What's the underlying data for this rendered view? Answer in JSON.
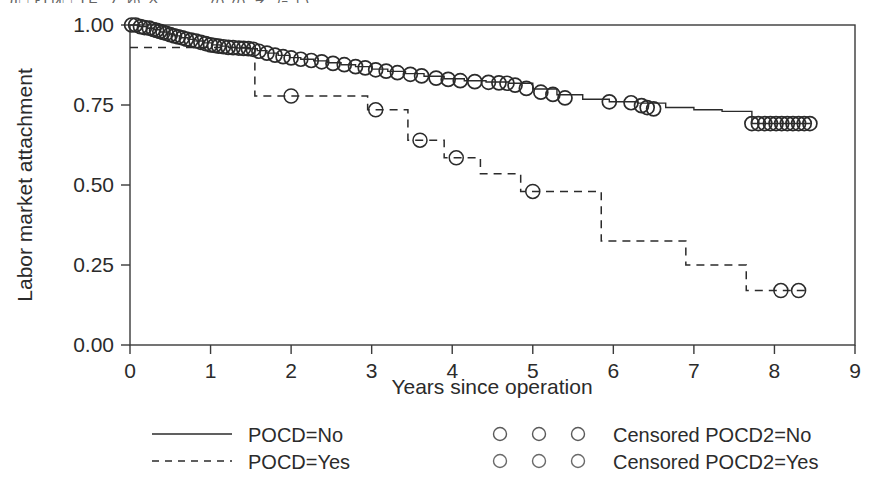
{
  "figure": {
    "top_cut_text": "Д□ гТИ□ ТЕ ノ ゆ へ こ こ の の え た い 二",
    "background": "#ffffff",
    "line_color": "#2b2b2b"
  },
  "chart_data": {
    "type": "line",
    "title": "",
    "subtitle": "",
    "xlabel": "Years since operation",
    "ylabel": "Labor market attachment",
    "xlim": [
      0,
      9
    ],
    "ylim": [
      0,
      1
    ],
    "xticks": [
      0,
      1,
      2,
      3,
      4,
      5,
      6,
      7,
      8,
      9
    ],
    "xtick_labels": [
      "0",
      "1",
      "2",
      "3",
      "4",
      "5",
      "6",
      "7",
      "8",
      "9"
    ],
    "yticks": [
      0.0,
      0.25,
      0.5,
      0.75,
      1.0
    ],
    "ytick_labels": [
      "0.00",
      "0.25",
      "0.50",
      "0.75",
      "1.00"
    ],
    "grid": false,
    "legend_position": "below-axes",
    "step_type": "post",
    "series": [
      {
        "name": "POCD=No",
        "style": "solid",
        "x": [
          0.0,
          0.12,
          0.22,
          0.3,
          0.38,
          0.46,
          0.55,
          0.64,
          0.72,
          0.82,
          0.92,
          1.02,
          1.12,
          1.22,
          1.33,
          1.45,
          1.58,
          1.7,
          1.84,
          1.98,
          2.12,
          2.28,
          2.45,
          2.62,
          2.8,
          3.0,
          3.2,
          3.42,
          3.65,
          3.9,
          4.15,
          4.42,
          4.7,
          5.0,
          5.3,
          5.62,
          5.95,
          6.3,
          6.65,
          7.0,
          7.35,
          7.72,
          8.45
        ],
        "y": [
          1.0,
          0.995,
          0.99,
          0.985,
          0.978,
          0.972,
          0.966,
          0.96,
          0.955,
          0.95,
          0.944,
          0.938,
          0.934,
          0.93,
          0.928,
          0.926,
          0.92,
          0.912,
          0.905,
          0.898,
          0.893,
          0.888,
          0.882,
          0.876,
          0.87,
          0.862,
          0.855,
          0.848,
          0.84,
          0.832,
          0.826,
          0.822,
          0.818,
          0.8,
          0.782,
          0.768,
          0.76,
          0.756,
          0.742,
          0.735,
          0.73,
          0.692,
          0.692
        ]
      },
      {
        "name": "POCD=Yes",
        "style": "dashed",
        "x": [
          0.0,
          1.55,
          2.95,
          3.45,
          3.9,
          4.35,
          4.85,
          5.85,
          6.9,
          7.65,
          8.4
        ],
        "y": [
          0.93,
          0.778,
          0.735,
          0.64,
          0.585,
          0.535,
          0.48,
          0.325,
          0.25,
          0.17,
          0.17
        ]
      }
    ],
    "censored_marks": [
      {
        "name": "Censored POCD2=No",
        "marker": "open-circle",
        "points": [
          [
            0.02,
            1.0
          ],
          [
            0.07,
            1.0
          ],
          [
            0.13,
            0.995
          ],
          [
            0.18,
            0.992
          ],
          [
            0.24,
            0.99
          ],
          [
            0.29,
            0.986
          ],
          [
            0.33,
            0.983
          ],
          [
            0.37,
            0.98
          ],
          [
            0.41,
            0.977
          ],
          [
            0.45,
            0.974
          ],
          [
            0.5,
            0.97
          ],
          [
            0.55,
            0.966
          ],
          [
            0.6,
            0.963
          ],
          [
            0.65,
            0.96
          ],
          [
            0.7,
            0.956
          ],
          [
            0.76,
            0.953
          ],
          [
            0.82,
            0.95
          ],
          [
            0.88,
            0.946
          ],
          [
            0.94,
            0.942
          ],
          [
            1.0,
            0.938
          ],
          [
            1.05,
            0.936
          ],
          [
            1.1,
            0.934
          ],
          [
            1.16,
            0.932
          ],
          [
            1.22,
            0.93
          ],
          [
            1.28,
            0.929
          ],
          [
            1.35,
            0.928
          ],
          [
            1.41,
            0.927
          ],
          [
            1.47,
            0.926
          ],
          [
            1.53,
            0.924
          ],
          [
            1.6,
            0.918
          ],
          [
            1.7,
            0.912
          ],
          [
            1.8,
            0.906
          ],
          [
            1.9,
            0.901
          ],
          [
            2.0,
            0.897
          ],
          [
            2.12,
            0.893
          ],
          [
            2.25,
            0.889
          ],
          [
            2.38,
            0.885
          ],
          [
            2.52,
            0.88
          ],
          [
            2.66,
            0.876
          ],
          [
            2.8,
            0.87
          ],
          [
            2.92,
            0.866
          ],
          [
            3.05,
            0.86
          ],
          [
            3.18,
            0.856
          ],
          [
            3.32,
            0.851
          ],
          [
            3.48,
            0.846
          ],
          [
            3.62,
            0.841
          ],
          [
            3.8,
            0.834
          ],
          [
            3.95,
            0.83
          ],
          [
            4.1,
            0.826
          ],
          [
            4.28,
            0.823
          ],
          [
            4.45,
            0.821
          ],
          [
            4.58,
            0.819
          ],
          [
            4.68,
            0.818
          ],
          [
            4.78,
            0.812
          ],
          [
            4.92,
            0.802
          ],
          [
            5.1,
            0.79
          ],
          [
            5.25,
            0.783
          ],
          [
            5.4,
            0.772
          ],
          [
            5.95,
            0.76
          ],
          [
            6.22,
            0.757
          ],
          [
            6.35,
            0.748
          ],
          [
            6.42,
            0.742
          ],
          [
            6.5,
            0.738
          ],
          [
            7.72,
            0.692
          ],
          [
            7.8,
            0.692
          ],
          [
            7.88,
            0.692
          ],
          [
            7.95,
            0.692
          ],
          [
            8.02,
            0.692
          ],
          [
            8.09,
            0.692
          ],
          [
            8.16,
            0.692
          ],
          [
            8.23,
            0.692
          ],
          [
            8.3,
            0.692
          ],
          [
            8.37,
            0.692
          ],
          [
            8.44,
            0.692
          ]
        ]
      },
      {
        "name": "Censored POCD2=Yes",
        "marker": "open-circle",
        "points": [
          [
            2.0,
            0.778
          ],
          [
            3.05,
            0.735
          ],
          [
            3.6,
            0.64
          ],
          [
            4.05,
            0.585
          ],
          [
            5.0,
            0.48
          ],
          [
            8.08,
            0.17
          ],
          [
            8.3,
            0.17
          ]
        ]
      }
    ]
  },
  "legend": {
    "entries": [
      {
        "label": "POCD=No",
        "style": "solid",
        "marker": "line"
      },
      {
        "label": "POCD=Yes",
        "style": "dashed",
        "marker": "line"
      },
      {
        "label": "Censored POCD2=No",
        "style": "circles",
        "marker": "open-circle"
      },
      {
        "label": "Censored POCD2=Yes",
        "style": "circles",
        "marker": "open-circle"
      }
    ]
  }
}
